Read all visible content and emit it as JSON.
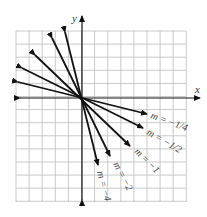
{
  "diagram": {
    "type": "coordinate-plane-lines-through-origin",
    "axes": {
      "x_label": "x",
      "y_label": "y"
    },
    "grid": {
      "left": 16,
      "top": 31,
      "right": 186,
      "bottom": 202,
      "cell": 13.1
    },
    "origin_px": [
      82,
      98
    ],
    "lines": [
      {
        "slope_label": "m = −1/4",
        "slope": -0.25,
        "tip": [
          147,
          114
        ],
        "tail": [
          18,
          82
        ],
        "label_pos": [
          150,
          118
        ],
        "label_rot": 20
      },
      {
        "slope_label": "m = −1/2",
        "slope": -0.5,
        "tip": [
          143,
          128
        ],
        "tail": [
          22,
          68
        ],
        "label_pos": [
          146,
          134
        ],
        "label_rot": 30
      },
      {
        "slope_label": "m = −1",
        "slope": -1,
        "tip": [
          130,
          146
        ],
        "tail": [
          35,
          55
        ],
        "label_pos": [
          134,
          152
        ],
        "label_rot": 45
      },
      {
        "slope_label": "m = −2",
        "slope": -2,
        "tip": [
          110,
          156
        ],
        "tail": [
          52,
          38
        ],
        "label_pos": [
          113,
          164
        ],
        "label_rot": 62
      },
      {
        "slope_label": "m = −4",
        "slope": -4,
        "tip": [
          98,
          165
        ],
        "tail": [
          65,
          32
        ],
        "label_pos": [
          97,
          172
        ],
        "label_rot": 75
      }
    ],
    "colors": {
      "grid": "#bdbdbd",
      "ink": "#111111",
      "label": "#333333"
    }
  }
}
